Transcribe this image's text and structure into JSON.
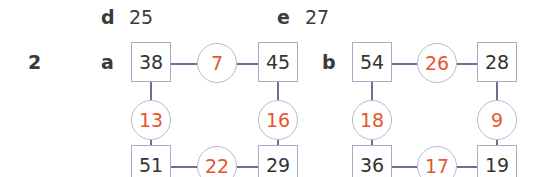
{
  "previous_answers": [
    {
      "label": "d",
      "value": "25"
    },
    {
      "label": "e",
      "value": "27"
    }
  ],
  "question": {
    "number": "2",
    "parts": [
      {
        "label": "a",
        "corners": {
          "top_left": "38",
          "top_right": "45",
          "bottom_left": "51",
          "bottom_right": "29"
        },
        "edges": {
          "top": "7",
          "left": "13",
          "right": "16",
          "bottom": "22"
        }
      },
      {
        "label": "b",
        "corners": {
          "top_left": "54",
          "top_right": "28",
          "bottom_left": "36",
          "bottom_right": "19"
        },
        "edges": {
          "top": "26",
          "left": "18",
          "right": "9",
          "bottom": "17"
        }
      }
    ]
  },
  "colors": {
    "corner_text": "#333333",
    "edge_text": "#e8552e",
    "connector": "#6b6f9a",
    "border": "#a9a9c8"
  }
}
